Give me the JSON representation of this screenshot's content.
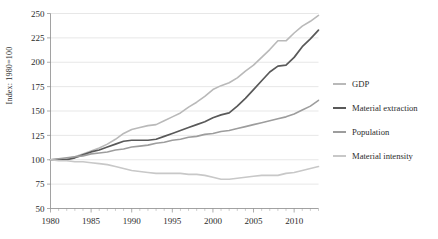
{
  "chart_data": {
    "type": "line",
    "title": "",
    "xlabel": "",
    "ylabel": "Index: 1980=100",
    "xlim": [
      1980,
      2013
    ],
    "ylim": [
      50,
      250
    ],
    "ytick_step": 25,
    "yticks": [
      50,
      75,
      100,
      125,
      150,
      175,
      200,
      225,
      250
    ],
    "xticks": [
      1980,
      1985,
      1990,
      1995,
      2000,
      2005,
      2010
    ],
    "xtick_minor_every": 1,
    "grid": "horizontal",
    "legend_position": "right",
    "x": [
      1980,
      1981,
      1982,
      1983,
      1984,
      1985,
      1986,
      1987,
      1988,
      1989,
      1990,
      1991,
      1992,
      1993,
      1994,
      1995,
      1996,
      1997,
      1998,
      1999,
      2000,
      2001,
      2002,
      2003,
      2004,
      2005,
      2006,
      2007,
      2008,
      2009,
      2010,
      2011,
      2012,
      2013
    ],
    "series": [
      {
        "name": "GDP",
        "color": "#b9b9b9",
        "width": 1.6,
        "values": [
          100,
          101,
          101,
          103,
          106,
          109,
          112,
          116,
          121,
          127,
          131,
          133,
          135,
          136,
          140,
          144,
          148,
          154,
          159,
          165,
          172,
          176,
          179,
          184,
          191,
          197,
          205,
          213,
          222,
          222,
          230,
          237,
          242,
          248
        ]
      },
      {
        "name": "Material extraction",
        "color": "#595959",
        "width": 1.7,
        "values": [
          100,
          100,
          100,
          102,
          105,
          108,
          110,
          113,
          116,
          119,
          120,
          120,
          120,
          121,
          124,
          127,
          130,
          133,
          136,
          139,
          143,
          146,
          148,
          155,
          163,
          172,
          181,
          190,
          196,
          197,
          205,
          216,
          224,
          233
        ]
      },
      {
        "name": "Population",
        "color": "#9d9d9d",
        "width": 1.6,
        "values": [
          100,
          101,
          102,
          103,
          104,
          106,
          107,
          108,
          110,
          111,
          113,
          114,
          115,
          117,
          118,
          120,
          121,
          123,
          124,
          126,
          127,
          129,
          130,
          132,
          134,
          136,
          138,
          140,
          142,
          144,
          147,
          151,
          155,
          161
        ]
      },
      {
        "name": "Material intensity",
        "color": "#c8c8c8",
        "width": 1.6,
        "values": [
          100,
          99,
          99,
          98,
          98,
          97,
          96,
          95,
          93,
          91,
          89,
          88,
          87,
          86,
          86,
          86,
          86,
          85,
          85,
          84,
          82,
          80,
          80,
          81,
          82,
          83,
          84,
          84,
          84,
          86,
          87,
          89,
          91,
          93
        ]
      }
    ]
  },
  "legend": {
    "items": [
      {
        "label": "GDP"
      },
      {
        "label": "Material extraction"
      },
      {
        "label": "Population"
      },
      {
        "label": "Material intensity"
      }
    ]
  }
}
